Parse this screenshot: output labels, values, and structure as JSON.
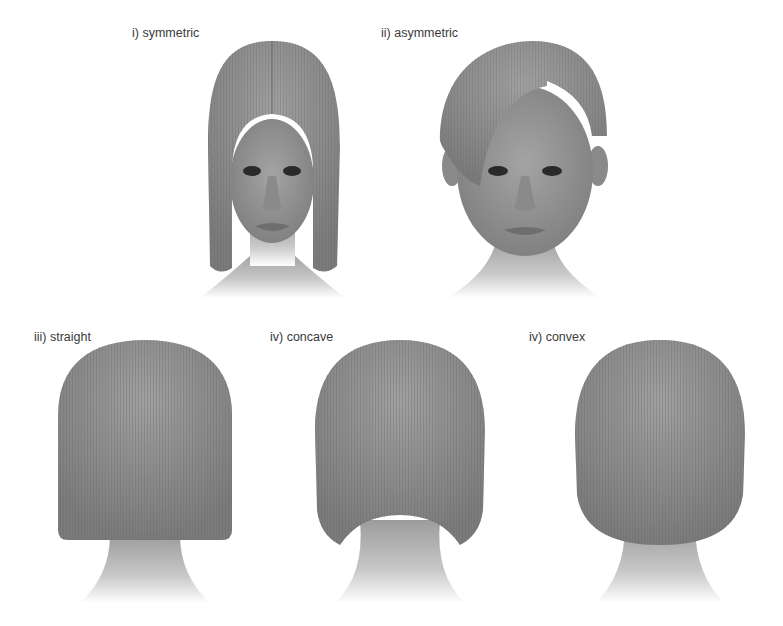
{
  "figures": [
    {
      "id": "symmetric",
      "label": "i) symmetric",
      "view": "front"
    },
    {
      "id": "asymmetric",
      "label": "ii) asymmetric",
      "view": "front"
    },
    {
      "id": "straight",
      "label": "iii) straight",
      "view": "back"
    },
    {
      "id": "concave",
      "label": "iv) concave",
      "view": "back"
    },
    {
      "id": "convex",
      "label": "iv) convex",
      "view": "back"
    }
  ],
  "colors": {
    "background": "#ffffff",
    "hair": "#8a8a8a",
    "hair_dark": "#6e6e6e",
    "hair_light": "#a8a8a8",
    "skin": "#9a9a9a",
    "skin_light": "#d8d8d8",
    "label_text": "#3a3a3a"
  }
}
